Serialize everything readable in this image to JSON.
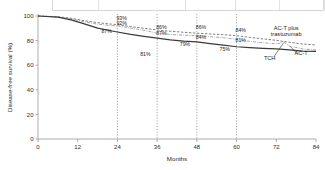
{
  "figure": {
    "top_banner_present": true,
    "background_color": "#ffffff"
  },
  "chart_data": {
    "type": "line",
    "title": "",
    "subtitle": "",
    "xlabel": "Months",
    "ylabel": "Disease-free survival (%)",
    "xlim": [
      0,
      84
    ],
    "ylim": [
      0,
      100
    ],
    "xticks": [
      0,
      12,
      24,
      36,
      48,
      60,
      72,
      84
    ],
    "xtick_labels": [
      "0",
      "12",
      "24",
      "36",
      "48",
      "60",
      "72",
      "84"
    ],
    "yticks": [
      0,
      20,
      40,
      60,
      80,
      100
    ],
    "ytick_labels": [
      "0",
      "20",
      "40",
      "60",
      "80",
      "100"
    ],
    "grid": "vertical dotted at 24, 36, 48, 60",
    "gridlines_x": [
      24,
      36,
      48,
      60
    ],
    "legend_position": "inline annotations at right of curves",
    "series": [
      {
        "name": "AC-T plus trastuzumab",
        "style": "dashed",
        "color": "#6f6f6f",
        "x": [
          0,
          6,
          10,
          14,
          18,
          22,
          24,
          28,
          32,
          36,
          40,
          44,
          48,
          52,
          56,
          60,
          64,
          68,
          72,
          74,
          76,
          80,
          84
        ],
        "y": [
          100,
          99.4,
          98.2,
          96.2,
          94.6,
          93.4,
          93,
          91.4,
          90,
          88.6,
          87.6,
          86.8,
          86,
          85.4,
          84.8,
          84,
          82.6,
          81.4,
          80.2,
          79.4,
          78.6,
          77.2,
          76.4
        ]
      },
      {
        "name": "TCH",
        "style": "dash-dot",
        "color": "#9b9b9b",
        "x": [
          0,
          6,
          10,
          14,
          18,
          22,
          24,
          28,
          32,
          36,
          40,
          44,
          48,
          52,
          56,
          60,
          64,
          68,
          72,
          73,
          74,
          76,
          80,
          84
        ],
        "y": [
          100,
          99.2,
          97.6,
          95.2,
          93.4,
          92.2,
          92,
          90.2,
          88.4,
          86,
          85,
          84.4,
          84,
          83.2,
          82.4,
          81,
          79.4,
          78.2,
          77.4,
          77.8,
          79.2,
          75.6,
          73.2,
          72.4
        ]
      },
      {
        "name": "AC-T",
        "style": "solid",
        "color": "#3a3a3a",
        "x": [
          0,
          6,
          10,
          14,
          18,
          22,
          24,
          28,
          32,
          36,
          40,
          44,
          48,
          52,
          56,
          60,
          64,
          68,
          72,
          74,
          76,
          80,
          84
        ],
        "y": [
          100,
          99,
          96.8,
          93.6,
          90.2,
          88,
          87,
          85,
          83.4,
          82,
          80.6,
          79.6,
          79,
          77.6,
          76.4,
          75,
          74.2,
          73.6,
          73.2,
          72.8,
          72.4,
          71.4,
          71.2
        ]
      }
    ],
    "point_labels": [
      {
        "text": "93%",
        "x": 24,
        "y": 93,
        "series": "AC-T plus trastuzumab",
        "dx": -1,
        "dy": -5
      },
      {
        "text": "92%",
        "x": 24,
        "y": 92,
        "series": "TCH",
        "dx": -1,
        "dy": -1
      },
      {
        "text": "87%",
        "x": 24,
        "y": 87,
        "series": "AC-T",
        "dx": -16,
        "dy": 1
      },
      {
        "text": "81%",
        "x": 36,
        "y": 81,
        "series": "AC-T",
        "dx": -17,
        "dy": 17
      },
      {
        "text": "86%",
        "x": 36,
        "y": 86,
        "series": "AC-T plus trastuzumab",
        "dx": -1,
        "dy": -4
      },
      {
        "text": "87%",
        "x": 36,
        "y": 86,
        "series": "TCH",
        "dx": -1,
        "dy": 2
      },
      {
        "text": "86%",
        "x": 48,
        "y": 86,
        "series": "AC-T plus trastuzumab",
        "dx": -1,
        "dy": -4
      },
      {
        "text": "84%",
        "x": 48,
        "y": 84,
        "series": "TCH",
        "dx": -1,
        "dy": 3
      },
      {
        "text": "79%",
        "x": 48,
        "y": 79,
        "series": "AC-T",
        "dx": -17,
        "dy": 4
      },
      {
        "text": "84%",
        "x": 60,
        "y": 84,
        "series": "AC-T plus trastuzumab",
        "dx": -1,
        "dy": -4
      },
      {
        "text": "81%",
        "x": 60,
        "y": 81,
        "series": "TCH",
        "dx": -1,
        "dy": 3
      },
      {
        "text": "75%",
        "x": 60,
        "y": 75,
        "series": "AC-T",
        "dx": -17,
        "dy": 4
      }
    ],
    "annotations": [
      {
        "text_line1": "AC-T plus",
        "text_line2": "trastuzumab",
        "x": 75,
        "y": 89
      },
      {
        "text_line1": "TCH",
        "text_line2": "",
        "x": 70,
        "y": 64
      },
      {
        "text_line1": "AC-T",
        "text_line2": "",
        "x": 79.5,
        "y": 68
      }
    ]
  }
}
